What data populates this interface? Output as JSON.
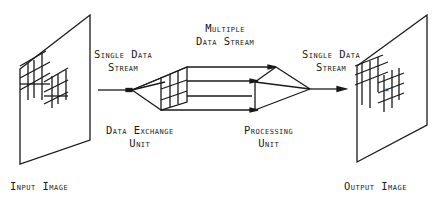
{
  "labels": {
    "input_image": "Input Image",
    "output_image": "Output Image",
    "single_in_1": "Single Data",
    "single_in_2": "Stream",
    "multiple_1": "Multiple",
    "multiple_2": "Data Stream",
    "single_out_1": "Single Data",
    "single_out_2": "Stream",
    "dxu_1": "Data Exchange",
    "dxu_2": "Unit",
    "pu_1": "Processing",
    "pu_2": "Unit"
  },
  "colors": {
    "ink": "#1a1a1a",
    "background": "#ffffff"
  }
}
